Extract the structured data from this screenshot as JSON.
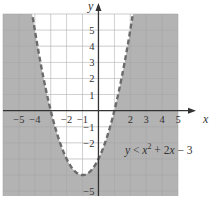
{
  "chart_data": {
    "type": "area",
    "title": "",
    "xlabel": "x",
    "ylabel": "y",
    "xlim": [
      -6,
      5
    ],
    "ylim": [
      -5.3,
      6
    ],
    "grid": true,
    "x_ticks": [
      -5,
      -4,
      -2,
      -1,
      2,
      3,
      4,
      5
    ],
    "x_tick_labels": [
      "−5",
      "−4",
      "−2",
      "−1",
      "2",
      "3",
      "4",
      "5"
    ],
    "y_ticks": [
      5,
      4,
      3,
      2,
      1,
      -1,
      -2,
      -5
    ],
    "y_tick_labels": [
      "5",
      "4",
      "3",
      "2",
      "1",
      "−1",
      "−2",
      "−5"
    ],
    "boundary": {
      "equation": "y = x^2 + 2x - 3",
      "a": 1,
      "b": 2,
      "c": -3,
      "style": "dashed",
      "vertex": [
        -1,
        -4
      ],
      "roots": [
        -3,
        1
      ]
    },
    "inequality": "y < x^2 + 2x - 3",
    "shaded_region": "below-outside-parabola",
    "annotation": {
      "prefix": "y",
      "op": " < ",
      "x": "x",
      "exp": "2",
      "rest": " + 2",
      "x2": "x",
      "tail": " − 3"
    },
    "colors": {
      "shade": "#b3b3b3",
      "grid": "#dcdcdc",
      "grid_on_shade": "#9e9e9e",
      "axis": "#333333",
      "curve": "#6b6b6b"
    }
  }
}
